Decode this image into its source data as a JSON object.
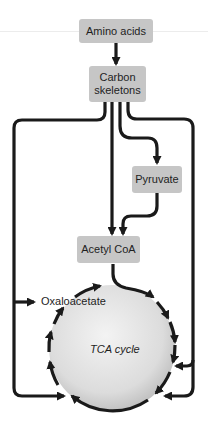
{
  "diagram": {
    "nodes": {
      "amino_acids": "Amino acids",
      "carbon_skeletons_line1": "Carbon",
      "carbon_skeletons_line2": "skeletons",
      "pyruvate": "Pyruvate",
      "acetyl_coa": "Acetyl CoA",
      "oxaloacetate": "Oxaloacetate",
      "tca_cycle": "TCA cycle"
    },
    "edges": [
      {
        "from": "Amino acids",
        "to": "Carbon skeletons"
      },
      {
        "from": "Carbon skeletons",
        "to": "Pyruvate"
      },
      {
        "from": "Carbon skeletons",
        "to": "Acetyl CoA"
      },
      {
        "from": "Pyruvate",
        "to": "Acetyl CoA"
      },
      {
        "from": "Acetyl CoA",
        "to": "TCA cycle"
      },
      {
        "from": "Carbon skeletons",
        "to": "Oxaloacetate"
      },
      {
        "from": "Carbon skeletons",
        "to": "TCA cycle (lower left)"
      },
      {
        "from": "Carbon skeletons",
        "to": "TCA cycle (right)"
      },
      {
        "from": "Carbon skeletons",
        "to": "TCA cycle (lower right)"
      }
    ],
    "colors": {
      "box_fill": "#c6c6c6",
      "line": "#1a1a1a",
      "circle_light": "#f0f0f0",
      "circle_dark": "#bdbdbd"
    }
  }
}
